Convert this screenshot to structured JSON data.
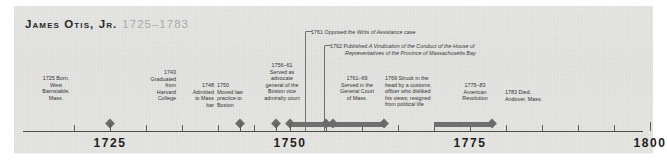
{
  "figure": {
    "kind": "historical-timeline",
    "background_color": "#e7e7e5",
    "marker_color": "#6b6b6b",
    "axis_color": "#4a4a4a"
  },
  "title": {
    "name": "James Otis, Jr.",
    "dates": "1725–1783"
  },
  "axis": {
    "labels": [
      "1725",
      "1750",
      "1775",
      "1800"
    ],
    "label_years": [
      1725,
      1750,
      1775,
      1800
    ],
    "range": [
      1718,
      1803
    ],
    "minor_tick_interval": 5
  },
  "callouts": [
    {
      "year_text": "1761",
      "text_plain": "1761 Opposed the Writs of Assistance case",
      "lead": "Opposed the ",
      "italic": "Writs of Assistance",
      "tail": " case",
      "anchor_year": 1761
    },
    {
      "year_text": "1762",
      "text_plain": "1762 Published A Vindication of the Conduct of the House of Representatives of the Province of Massachusetts Bay",
      "lead": "Published ",
      "italic_line1": "A Vindication of the Conduct of the House of",
      "italic_line2": "Representatives of the Province of Massachusetts Bay",
      "anchor_year": 1762
    }
  ],
  "events": [
    {
      "year_text": "1725",
      "lines": [
        "1725 Born,",
        "West",
        "Barnstable,",
        "Mass."
      ],
      "start_year": 1725,
      "end_year": 1725,
      "type": "point"
    },
    {
      "year_text": "1743",
      "lines": [
        "1743",
        "Graduated",
        "from",
        "Harvard",
        "College"
      ],
      "start_year": 1743,
      "end_year": 1743,
      "type": "point"
    },
    {
      "year_text": "1748",
      "lines": [
        "1748",
        "Admitted",
        "to Mass",
        "bar"
      ],
      "start_year": 1748,
      "end_year": 1748,
      "type": "point"
    },
    {
      "year_text": "1750",
      "lines": [
        "1750",
        "Moved law",
        "practice to",
        "Boston"
      ],
      "start_year": 1750,
      "end_year": 1750,
      "type": "point"
    },
    {
      "year_text": "1756–61",
      "lines": [
        "1756–61",
        "Served as",
        "advocate",
        "general of the",
        "Boston vice",
        "admiralty court"
      ],
      "start_year": 1756,
      "end_year": 1761,
      "type": "span"
    },
    {
      "year_text": "1761–69",
      "lines": [
        "1761–69",
        "Served in the",
        "General Court",
        "of Mass."
      ],
      "start_year": 1761,
      "end_year": 1769,
      "type": "span"
    },
    {
      "year_text": "1769",
      "lines": [
        "1769 Struck in the",
        "head by a customs",
        "officer who disliked",
        "his views; resigned",
        "from political life"
      ],
      "start_year": 1769,
      "end_year": 1769,
      "type": "point"
    },
    {
      "year_text": "1775–83",
      "lines": [
        "1775–83",
        "American",
        "Revolution"
      ],
      "start_year": 1775,
      "end_year": 1783,
      "type": "span"
    },
    {
      "year_text": "1783",
      "lines": [
        "1783 Died,",
        "Andover, Mass."
      ],
      "start_year": 1783,
      "end_year": 1783,
      "type": "point"
    }
  ]
}
